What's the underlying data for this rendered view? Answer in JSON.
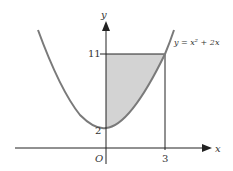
{
  "figure": {
    "axis_x_label": "x",
    "axis_y_label": "y",
    "origin_label": "O",
    "tick_x_label": "3",
    "tick_y_top_label": "11",
    "tick_y_bottom_label": "2",
    "curve_label": "y = x² + 2x",
    "colors": {
      "curve": "#7a7a7a",
      "shade": "#d3d3d3",
      "axis": "#222222"
    }
  }
}
